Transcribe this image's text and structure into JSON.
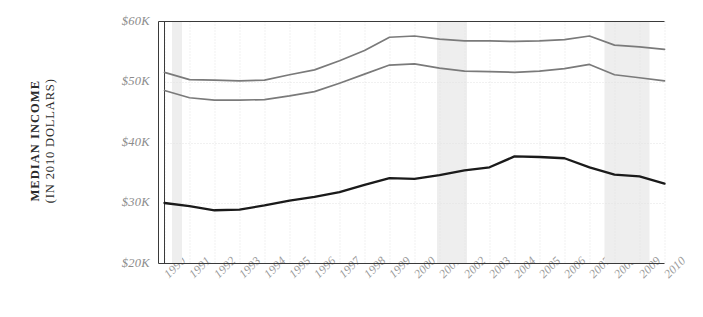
{
  "chart_data": {
    "type": "line",
    "title": "",
    "subtitle": "",
    "xlabel": "",
    "ylabel": "MEDIAN INCOME (IN 2010 DOLLARS)",
    "ylabel_line1": "MEDIAN INCOME",
    "ylabel_line2": "(IN 2010 DOLLARS)",
    "x": [
      1990,
      1991,
      1992,
      1993,
      1994,
      1995,
      1996,
      1997,
      1998,
      1999,
      2000,
      2001,
      2002,
      2003,
      2004,
      2005,
      2006,
      2007,
      2008,
      2009,
      2010
    ],
    "x_tick_labels": [
      "1990",
      "1991",
      "1992",
      "1993",
      "1994",
      "1995",
      "1996",
      "1997",
      "1998",
      "1999",
      "2000",
      "2001",
      "2002",
      "2003",
      "2004",
      "2005",
      "2006",
      "2007",
      "2008",
      "2009",
      "2010"
    ],
    "ylim": [
      20000,
      61000
    ],
    "y_ticks": [
      20000,
      30000,
      40000,
      50000,
      60000
    ],
    "y_tick_labels": [
      "$20K",
      "$30K",
      "$40K",
      "$50K",
      "$60K"
    ],
    "grid": true,
    "legend": "none",
    "series": [
      {
        "name": "upper-gray-line",
        "color": "#7a7a7a",
        "values": [
          51600,
          50400,
          50300,
          50200,
          50300,
          51200,
          52000,
          53500,
          55200,
          57400,
          57600,
          57100,
          56800,
          56800,
          56700,
          56800,
          57000,
          57600,
          56100,
          55800,
          55400
        ]
      },
      {
        "name": "middle-gray-line",
        "color": "#7a7a7a",
        "values": [
          48600,
          47400,
          47000,
          47000,
          47100,
          47700,
          48400,
          49800,
          51300,
          52800,
          53000,
          52300,
          51800,
          51700,
          51600,
          51800,
          52200,
          52900,
          51200,
          50700,
          50200
        ]
      },
      {
        "name": "lower-black-line",
        "color": "#1a1a1a",
        "values": [
          30000,
          29500,
          28800,
          28900,
          29600,
          30400,
          31000,
          31800,
          33000,
          34100,
          34000,
          34600,
          35400,
          35900,
          37700,
          37600,
          37400,
          35900,
          34700,
          34400,
          33200
        ]
      }
    ],
    "recession_bands": [
      {
        "label": "1990-1991 recession",
        "start": 1990.3,
        "end": 1990.7
      },
      {
        "label": "2001 recession",
        "start": 2000.9,
        "end": 2002.1
      },
      {
        "label": "2007-2009 recession",
        "start": 2007.6,
        "end": 2009.4
      }
    ],
    "recession_band_color": "#eeeeee"
  },
  "axis": {
    "axis_color": "#3a3a3a",
    "grid_color": "#e2e2e2",
    "tick_text_color": "#8c8c8c",
    "title_text_color": "#2b2b2b"
  }
}
